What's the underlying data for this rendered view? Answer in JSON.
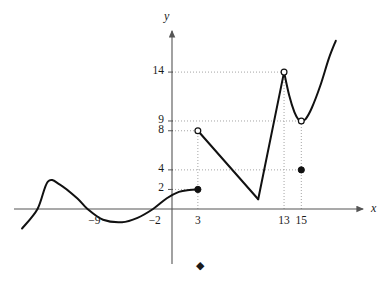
{
  "figure": {
    "axis_labels": {
      "x": "x",
      "y": "y"
    },
    "colors": {
      "curve": "#111111",
      "axis": "#555555",
      "grid": "#9a9a9a",
      "text": "#1a1a1a"
    }
  },
  "chart_data": {
    "type": "line",
    "title": "",
    "xlabel": "x",
    "ylabel": "y",
    "xlim": [
      -16,
      22
    ],
    "ylim": [
      -4.5,
      19
    ],
    "grid": "dotted-guides-only",
    "legend": "none",
    "x_ticks": [
      {
        "label": "−9",
        "value": -9
      },
      {
        "label": "−2",
        "value": -2
      },
      {
        "label": "3",
        "value": 3
      },
      {
        "label": "13",
        "value": 13
      },
      {
        "label": "15",
        "value": 15
      }
    ],
    "y_ticks": [
      {
        "label": "2",
        "value": 2
      },
      {
        "label": "4",
        "value": 4
      },
      {
        "label": "8",
        "value": 8
      },
      {
        "label": "9",
        "value": 9
      },
      {
        "label": "14",
        "value": 14
      }
    ],
    "series": [
      {
        "name": "left-cubic-branch",
        "type": "curve",
        "points": [
          [
            -17.4,
            -2.0
          ],
          [
            -15.6,
            0.0
          ],
          [
            -14.4,
            2.8
          ],
          [
            -13.0,
            2.5
          ],
          [
            -11.0,
            1.1
          ],
          [
            -9.8,
            0.0
          ],
          [
            -8.0,
            -1.1
          ],
          [
            -5.8,
            -1.35
          ],
          [
            -4.0,
            -0.9
          ],
          [
            -2.2,
            0.0
          ],
          [
            -0.6,
            1.1
          ],
          [
            0.8,
            1.75
          ],
          [
            2.0,
            1.95
          ],
          [
            3.0,
            2.0
          ]
        ]
      },
      {
        "name": "descending-segment",
        "type": "line",
        "points": [
          [
            3,
            8
          ],
          [
            10,
            1
          ]
        ]
      },
      {
        "name": "rising-segment",
        "type": "line",
        "points": [
          [
            10,
            1
          ],
          [
            13,
            14
          ]
        ]
      },
      {
        "name": "right-valley-curve",
        "type": "curve",
        "points": [
          [
            13.0,
            14.0
          ],
          [
            13.6,
            11.6
          ],
          [
            14.2,
            9.9
          ],
          [
            14.7,
            9.1
          ],
          [
            15.0,
            9.0
          ],
          [
            15.5,
            9.2
          ],
          [
            16.2,
            10.3
          ],
          [
            17.2,
            12.6
          ],
          [
            18.2,
            15.4
          ],
          [
            19.0,
            17.2
          ]
        ]
      }
    ],
    "markers": [
      {
        "name": "closed-point-3-2",
        "x": 3,
        "y": 2,
        "style": "filled"
      },
      {
        "name": "open-point-3-8",
        "x": 3,
        "y": 8,
        "style": "open"
      },
      {
        "name": "open-point-13-14",
        "x": 13,
        "y": 14,
        "style": "open"
      },
      {
        "name": "open-point-15-9",
        "x": 15,
        "y": 9,
        "style": "open"
      },
      {
        "name": "closed-point-15-4",
        "x": 15,
        "y": 4,
        "style": "filled"
      }
    ],
    "guide_lines": [
      {
        "name": "guide-h-14",
        "orientation": "horizontal",
        "value": 14,
        "from_x": 0,
        "to_x": 13
      },
      {
        "name": "guide-h-9",
        "orientation": "horizontal",
        "value": 9,
        "from_x": 0,
        "to_x": 15
      },
      {
        "name": "guide-h-8",
        "orientation": "horizontal",
        "value": 8,
        "from_x": 0,
        "to_x": 3
      },
      {
        "name": "guide-h-4",
        "orientation": "horizontal",
        "value": 4,
        "from_x": 0,
        "to_x": 15
      },
      {
        "name": "guide-h-2",
        "orientation": "horizontal",
        "value": 2,
        "from_x": 0,
        "to_x": 3
      },
      {
        "name": "guide-v-3",
        "orientation": "vertical",
        "value": 3,
        "from_y": 0,
        "to_y": 8
      },
      {
        "name": "guide-v-13",
        "orientation": "vertical",
        "value": 13,
        "from_y": 0,
        "to_y": 14
      },
      {
        "name": "guide-v-15",
        "orientation": "vertical",
        "value": 15,
        "from_y": 0,
        "to_y": 9
      }
    ],
    "annotations": [
      {
        "name": "footer-diamond-marker",
        "symbol": "◆",
        "x_px": 201,
        "y_px": 268
      }
    ]
  }
}
